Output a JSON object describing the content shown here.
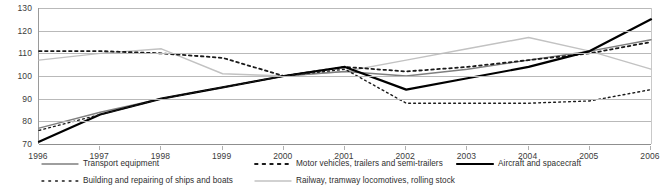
{
  "chart_data": {
    "type": "line",
    "title": "",
    "xlabel": "",
    "ylabel": "",
    "x": [
      1996,
      1997,
      1998,
      1999,
      2000,
      2001,
      2002,
      2003,
      2004,
      2005,
      2006
    ],
    "xtick_labels": [
      "1996",
      "1997",
      "1998",
      "1999",
      "2000",
      "2001",
      "2002",
      "2003",
      "2004",
      "2005",
      "2006"
    ],
    "ytick_labels": [
      "130",
      "120",
      "110",
      "100",
      "90",
      "80",
      "70"
    ],
    "yticks": [
      130,
      120,
      110,
      100,
      90,
      80,
      70
    ],
    "ylim": [
      70,
      130
    ],
    "grid": "horizontal",
    "legend_position": "bottom",
    "series": [
      {
        "name": "Transport equipment",
        "style": "solid",
        "color": "#7f7f7f",
        "width": 1.4,
        "values": [
          77,
          84,
          90,
          95,
          100,
          102,
          100,
          103,
          107,
          111,
          116
        ]
      },
      {
        "name": "Motor vehicles, trailers and semi-trailers",
        "style": "dotted",
        "color": "#1a1a1a",
        "width": 1.8,
        "values": [
          111,
          111,
          110,
          108,
          100,
          104,
          102,
          104,
          107,
          110,
          115
        ]
      },
      {
        "name": "Aircraft and spacecraft",
        "style": "solid",
        "color": "#000000",
        "width": 2.2,
        "values": [
          71,
          83,
          90,
          95,
          100,
          104,
          94,
          99,
          104,
          111,
          125
        ]
      },
      {
        "name": "Building and repairing of ships and boats",
        "style": "dotted",
        "color": "#1a1a1a",
        "width": 1.4,
        "values": [
          76,
          83,
          90,
          95,
          100,
          103,
          88,
          88,
          88,
          89,
          94
        ]
      },
      {
        "name": "Railway, tramway locomotives, rolling stock",
        "style": "solid",
        "color": "#c2c2c2",
        "width": 1.4,
        "values": [
          107,
          110,
          112,
          101,
          100,
          102,
          107,
          112,
          117,
          111,
          103
        ]
      }
    ]
  },
  "legend": {
    "items": [
      {
        "label": "Transport equipment"
      },
      {
        "label": "Motor vehicles, trailers and semi-trailers"
      },
      {
        "label": "Building and repairing of ships and boats"
      },
      {
        "label": "Railway, tramway locomotives, rolling stock"
      },
      {
        "label": "Aircraft and spacecraft"
      }
    ]
  }
}
